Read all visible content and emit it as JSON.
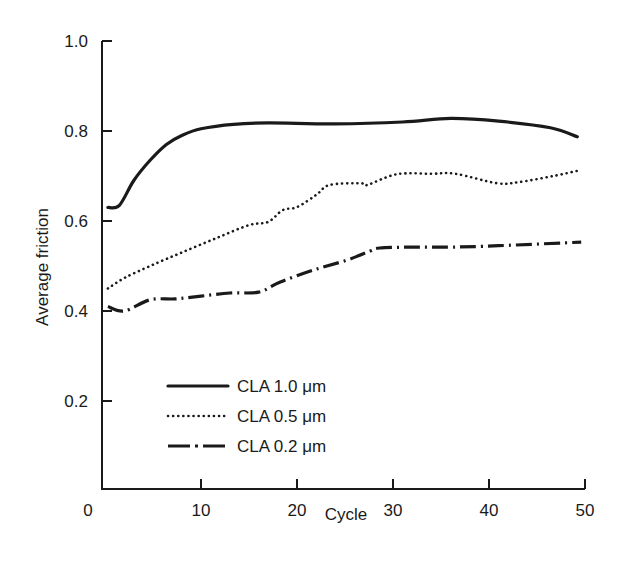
{
  "chart_data": {
    "type": "line",
    "title": "",
    "xlabel": "Cycle",
    "ylabel": "Average friction",
    "xlim": [
      0,
      50
    ],
    "ylim": [
      0,
      1.0
    ],
    "x_ticks": [
      0,
      10,
      20,
      30,
      40,
      50
    ],
    "x_tick_labels": [
      "0",
      "10",
      "20",
      "30",
      "40",
      "50"
    ],
    "y_ticks": [
      0.2,
      0.4,
      0.6,
      0.8,
      1.0
    ],
    "y_tick_labels": [
      "0.2",
      "0.4",
      "0.6",
      "0.8",
      "1.0"
    ],
    "grid": false,
    "legend_position": "bottom-left",
    "series": [
      {
        "name": "CLA 1.0 μm",
        "style": "solid",
        "color": "#1a1a1a",
        "x": [
          0.3,
          1.5,
          3,
          4.7,
          6.4,
          8,
          10,
          13.4,
          17,
          24,
          31,
          36,
          41,
          46.4,
          49.2
        ],
        "y": [
          0.63,
          0.635,
          0.69,
          0.735,
          0.77,
          0.79,
          0.805,
          0.815,
          0.818,
          0.816,
          0.82,
          0.828,
          0.822,
          0.807,
          0.787
        ]
      },
      {
        "name": "CLA 0.5 μm",
        "style": "dotted",
        "color": "#1a1a1a",
        "x": [
          0.3,
          2,
          4.7,
          8,
          11.6,
          15,
          17,
          18.5,
          20,
          22,
          23.4,
          26.6,
          27.3,
          30.4,
          34,
          36.5,
          40.8,
          43,
          46.7,
          49.5
        ],
        "y": [
          0.45,
          0.473,
          0.5,
          0.53,
          0.562,
          0.591,
          0.598,
          0.624,
          0.631,
          0.658,
          0.68,
          0.684,
          0.68,
          0.704,
          0.705,
          0.705,
          0.684,
          0.686,
          0.7,
          0.713
        ]
      },
      {
        "name": "CLA 0.2 μm",
        "style": "dash-dot",
        "color": "#1a1a1a",
        "x": [
          0.3,
          2,
          4.7,
          7.3,
          10,
          13,
          16,
          18.2,
          21.7,
          25.2,
          27.6,
          28.6,
          32,
          36,
          41,
          49.6
        ],
        "y": [
          0.41,
          0.4,
          0.425,
          0.427,
          0.433,
          0.44,
          0.442,
          0.464,
          0.491,
          0.513,
          0.533,
          0.54,
          0.542,
          0.542,
          0.545,
          0.553
        ]
      }
    ]
  }
}
